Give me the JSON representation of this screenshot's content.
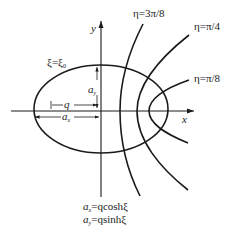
{
  "figure": {
    "type": "elliptic coordinate system diagram",
    "axes": {
      "x_label": "x",
      "y_label": "y"
    },
    "ellipse": {
      "label": "ξ=ξ",
      "label_sub": "0"
    },
    "hyperbolas": [
      {
        "label": "η=3π/8"
      },
      {
        "label": "η=π/4"
      },
      {
        "label": "η=π/8"
      }
    ],
    "dimensions": {
      "q_label": "q",
      "ax_label": "a",
      "ax_sub": "x",
      "ay_label": "a",
      "ay_sub": "y"
    },
    "equations": [
      {
        "lhs": "a",
        "sub": "x",
        "rhs": "=qcosh",
        "var": "ξ"
      },
      {
        "lhs": "a",
        "sub": "y",
        "rhs": "=qsinh",
        "var": "ξ"
      }
    ],
    "colors": {
      "stroke": "#1a1a1a",
      "background": "#ffffff"
    }
  }
}
